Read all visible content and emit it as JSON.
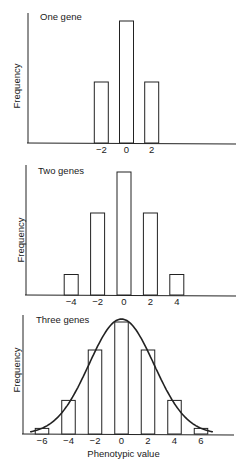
{
  "chart_data": [
    {
      "type": "bar",
      "title": "One gene",
      "xlabel": "",
      "ylabel": "Frequency",
      "categories": [
        "-2",
        "0",
        "2"
      ],
      "values": [
        1,
        2,
        1
      ],
      "tick_labels": [
        "−2",
        "0",
        "2"
      ],
      "grid": false
    },
    {
      "type": "bar",
      "title": "Two genes",
      "xlabel": "",
      "ylabel": "Frequency",
      "categories": [
        "-4",
        "-2",
        "0",
        "2",
        "4"
      ],
      "values": [
        1,
        4,
        6,
        4,
        1
      ],
      "tick_labels": [
        "−4",
        "−2",
        "0",
        "2",
        "4"
      ],
      "grid": false
    },
    {
      "type": "bar",
      "title": "Three genes",
      "xlabel": "Phenotypic value",
      "ylabel": "Frequency",
      "categories": [
        "-6",
        "-4",
        "-2",
        "0",
        "2",
        "4",
        "6"
      ],
      "values": [
        1,
        6,
        15,
        20,
        15,
        6,
        1
      ],
      "tick_labels": [
        "−6",
        "−4",
        "−2",
        "0",
        "2",
        "4",
        "6"
      ],
      "overlay": "normal distribution curve",
      "grid": false
    }
  ],
  "panels": [
    {
      "title": "One gene",
      "ylabel": "Frequency"
    },
    {
      "title": "Two genes",
      "ylabel": "Frequency"
    },
    {
      "title": "Three genes",
      "ylabel": "Frequency",
      "xlabel": "Phenotypic value"
    }
  ]
}
